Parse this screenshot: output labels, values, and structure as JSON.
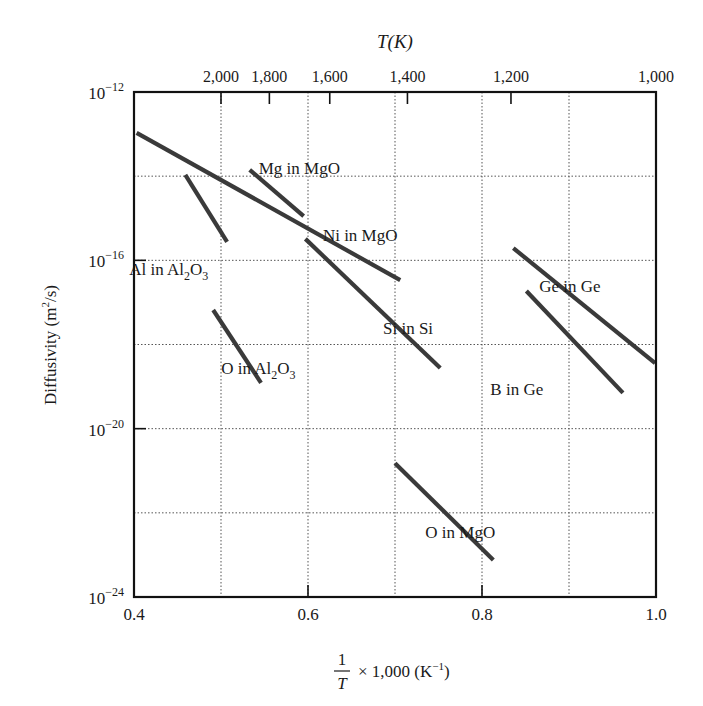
{
  "chart_data": {
    "type": "line",
    "title": "",
    "top_axis": {
      "label": "T(K)",
      "ticks": [
        {
          "label": "2,000",
          "x": 0.5
        },
        {
          "label": "1,800",
          "x": 0.5556
        },
        {
          "label": "1,600",
          "x": 0.625
        },
        {
          "label": "1,400",
          "x": 0.7143
        },
        {
          "label": "1,200",
          "x": 0.8333
        },
        {
          "label": "1,000",
          "x": 1.0
        }
      ]
    },
    "xlabel": "1/T × 1,000 (K⁻¹)",
    "xlabel_parts": {
      "numerator": "1",
      "denominator": "T",
      "rest": "× 1,000 (K",
      "sup": "−1",
      "close": ")"
    },
    "ylabel": "Diffusivity (m²/s)",
    "ylabel_parts": {
      "pre": "Diffusivity (m",
      "sup": "2",
      "post": "/s)"
    },
    "xlim": [
      0.4,
      1.0
    ],
    "ylim_log10": [
      -24,
      -12
    ],
    "y_scale": "log",
    "x_ticks": [
      {
        "value": 0.4,
        "label": "0.4"
      },
      {
        "value": 0.6,
        "label": "0.6"
      },
      {
        "value": 0.8,
        "label": "0.8"
      },
      {
        "value": 1.0,
        "label": "1.0"
      }
    ],
    "y_ticks": [
      {
        "exp": -12,
        "label_base": "10",
        "label_exp": "−12"
      },
      {
        "exp": -16,
        "label_base": "10",
        "label_exp": "−16"
      },
      {
        "exp": -20,
        "label_base": "10",
        "label_exp": "−20"
      },
      {
        "exp": -24,
        "label_base": "10",
        "label_exp": "−24"
      }
    ],
    "grid": {
      "x": [
        0.5,
        0.6,
        0.7,
        0.8,
        0.9
      ],
      "y_log10": [
        -14,
        -16,
        -18,
        -20,
        -22
      ],
      "style": "dotted"
    },
    "legend": "inline labels",
    "series": [
      {
        "name": "Ni in MgO",
        "x": [
          0.403,
          0.706
        ],
        "log10_D": [
          -12.97,
          -16.47
        ],
        "label": {
          "text": "Ni in MgO",
          "x": 0.66,
          "log10_D": -15.55
        }
      },
      {
        "name": "Mg in MgO",
        "x": [
          0.533,
          0.595
        ],
        "log10_D": [
          -13.85,
          -14.95
        ],
        "label": {
          "text": "Mg in MgO",
          "x": 0.59,
          "log10_D": -13.95
        }
      },
      {
        "name": "Al in Al2O3",
        "x": [
          0.459,
          0.507
        ],
        "log10_D": [
          -13.97,
          -15.56
        ],
        "label": {
          "text": "Al in Al",
          "sub": "2",
          "text2": "O",
          "sub2": "3",
          "x": 0.44,
          "log10_D": -16.35
        }
      },
      {
        "name": "Si in Si",
        "x": [
          0.597,
          0.752
        ],
        "log10_D": [
          -15.49,
          -18.56
        ],
        "label": {
          "text": "Si in Si",
          "x": 0.715,
          "log10_D": -17.75
        }
      },
      {
        "name": "O in Al2O3",
        "x": [
          0.491,
          0.546
        ],
        "log10_D": [
          -17.18,
          -18.91
        ],
        "label": {
          "text": "O in Al",
          "sub": "2",
          "text2": "O",
          "sub2": "3",
          "x": 0.543,
          "log10_D": -18.7
        }
      },
      {
        "name": "Ge in Ge",
        "x": [
          0.836,
          0.999
        ],
        "log10_D": [
          -15.71,
          -18.44
        ],
        "label": {
          "text": "Ge in Ge",
          "x": 0.901,
          "log10_D": -16.75
        }
      },
      {
        "name": "B in Ge",
        "x": [
          0.851,
          0.962
        ],
        "log10_D": [
          -16.73,
          -19.15
        ],
        "label": {
          "text": "B in Ge",
          "x": 0.84,
          "log10_D": -19.2
        }
      },
      {
        "name": "O in MgO",
        "x": [
          0.7,
          0.813
        ],
        "log10_D": [
          -20.82,
          -23.12
        ],
        "label": {
          "text": "O in MgO",
          "x": 0.775,
          "log10_D": -22.6
        }
      }
    ],
    "colors": {
      "line": "#3a3a3a",
      "axis": "#111111",
      "grid": "#555555",
      "text": "#1a1a1a"
    }
  }
}
